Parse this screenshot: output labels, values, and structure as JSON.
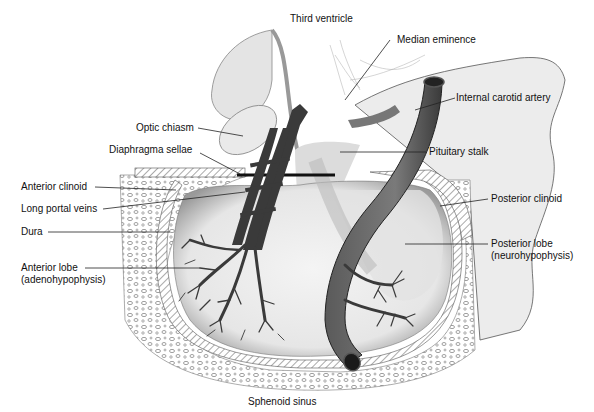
{
  "diagram": {
    "labels": {
      "third_ventricle": "Third ventricle",
      "median_eminence": "Median eminence",
      "internal_carotid_artery": "Internal carotid artery",
      "optic_chiasm": "Optic chiasm",
      "diaphragma_sellae": "Diaphragma sellae",
      "pituitary_stalk": "Pituitary stalk",
      "anterior_clinoid": "Anterior clinoid",
      "long_portal_veins": "Long portal veins",
      "posterior_clinoid": "Posterior clinoid",
      "dura": "Dura",
      "posterior_lobe_line1": "Posterior lobe",
      "posterior_lobe_line2": "(neurohypophysis)",
      "anterior_lobe_line1": "Anterior lobe",
      "anterior_lobe_line2": "(adenohypophysis)",
      "sphenoid_sinus": "Sphenoid sinus"
    },
    "colors": {
      "background": "#ffffff",
      "tissue_light": "#e8e8e8",
      "tissue_mid": "#c8c8c8",
      "vessel_dark": "#3a3a3a",
      "artery": "#6e6e6e",
      "leader_line": "#222222"
    }
  }
}
